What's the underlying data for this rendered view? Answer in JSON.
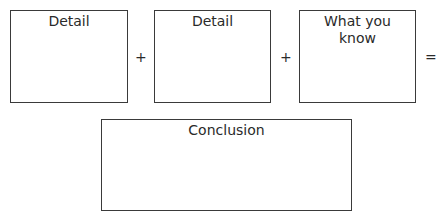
{
  "diagram": {
    "type": "equation-organizer",
    "boxes": [
      {
        "label": "Detail"
      },
      {
        "label": "Detail"
      },
      {
        "label": "What you know"
      }
    ],
    "operators": [
      "+",
      "+",
      "="
    ],
    "result": {
      "label": "Conclusion"
    }
  },
  "colors": {
    "border": "#3a3a3a",
    "text": "#2a2a2a",
    "background": "#ffffff"
  }
}
